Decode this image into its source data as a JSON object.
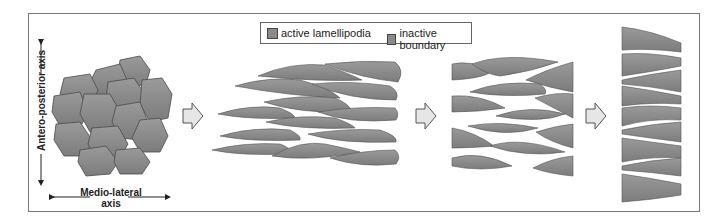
{
  "legend": {
    "items": [
      {
        "label": "active lamellipodia",
        "color": "#8a8a8a"
      },
      {
        "label": "inactive boundary",
        "color": "#8a8a8a"
      }
    ]
  },
  "axes": {
    "vertical": "Antero-posterior axis",
    "horizontal_line1": "Medio-lateral",
    "horizontal_line2": "axis"
  },
  "colors": {
    "cell_fill": "#8c8c8c",
    "cell_stroke": "#4a4a4a",
    "arrow_fill": "#e6e6e6",
    "arrow_stroke": "#555555"
  },
  "stages": [
    "round-cell-cluster",
    "elongating-cells",
    "intercalating-cells",
    "convergent-extended-column"
  ]
}
